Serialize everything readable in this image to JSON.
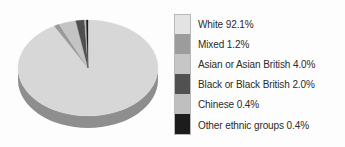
{
  "chart_data": {
    "type": "pie",
    "title": "",
    "subtitle": "",
    "xlabel": "",
    "ylabel": "",
    "legend_position": "right",
    "three_d": true,
    "categories": [
      "White",
      "Mixed",
      "Asian or Asian British",
      "Black or Black British",
      "Chinese",
      "Other ethnic groups"
    ],
    "values": [
      92.1,
      1.2,
      4.0,
      2.0,
      0.4,
      0.4
    ],
    "value_unit": "%",
    "slices": [
      {
        "label": "White",
        "value": 92.1,
        "value_text": "92.1%",
        "color": "#d7d7d7",
        "side_color": "#8e8e8e",
        "legend_text": "White 92.1%"
      },
      {
        "label": "Mixed",
        "value": 1.2,
        "value_text": "1.2%",
        "color": "#9a9a9a",
        "side_color": "#6e6e6e",
        "legend_text": "Mixed 1.2%"
      },
      {
        "label": "Asian or Asian British",
        "value": 4.0,
        "value_text": "4.0%",
        "color": "#c4c4c4",
        "side_color": "#8b8b8b",
        "legend_text": "Asian or Asian British 4.0%"
      },
      {
        "label": "Black or Black British",
        "value": 2.0,
        "value_text": "2.0%",
        "color": "#4f4f4f",
        "side_color": "#3a3a3a",
        "legend_text": "Black or Black British 2.0%"
      },
      {
        "label": "Chinese",
        "value": 0.4,
        "value_text": "0.4%",
        "color": "#bdbdbd",
        "side_color": "#878787",
        "legend_text": "Chinese 0.4%"
      },
      {
        "label": "Other ethnic groups",
        "value": 0.4,
        "value_text": "0.4%",
        "color": "#1e1e1e",
        "side_color": "#141414",
        "legend_text": "Other ethnic groups 0.4%"
      }
    ]
  },
  "legend": {
    "items": [
      {
        "text": "White 92.1%",
        "swatch": "#e3e3e3"
      },
      {
        "text": "Mixed 1.2%",
        "swatch": "#9c9c9c"
      },
      {
        "text": "Asian or Asian British 4.0%",
        "swatch": "#c6c6c6"
      },
      {
        "text": "Black or Black British 2.0%",
        "swatch": "#515151"
      },
      {
        "text": "Chinese 0.4%",
        "swatch": "#bfbfbf"
      },
      {
        "text": "Other ethnic groups 0.4%",
        "swatch": "#1c1c1c"
      }
    ]
  },
  "colors": {
    "background": "#fdfdfd",
    "text": "#2b2b2b",
    "swatch_border": "#b8b8b8"
  }
}
